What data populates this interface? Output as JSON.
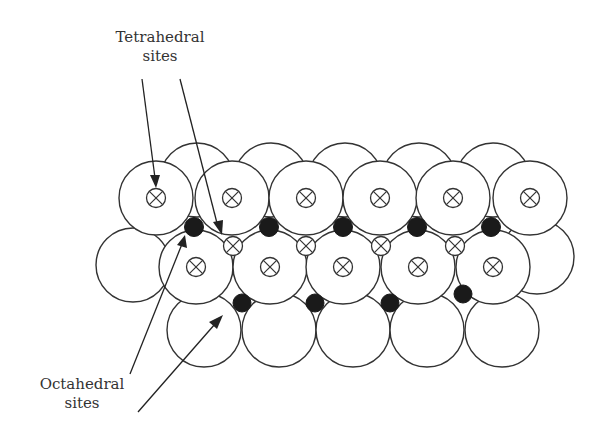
{
  "diagram": {
    "type": "close-packed sphere layers showing interstitial sites",
    "labels": {
      "tetrahedral": {
        "line1": "Tetrahedral",
        "line2": "sites"
      },
      "octahedral": {
        "line1": "Octahedral",
        "line2": "sites"
      }
    },
    "legend_symbols": {
      "tetrahedral_site": "crossed-circle",
      "octahedral_site": "filled-circle"
    },
    "colors": {
      "outline": "#333333",
      "octahedral_fill": "#1a1a1a",
      "background": "#ffffff"
    },
    "counts": {
      "front_top_row_atoms": 6,
      "front_middle_row_atoms": 5,
      "bottom_row_atoms": 5,
      "tetrahedral_sites_between_rows": 4,
      "octahedral_sites_upper": 5,
      "octahedral_sites_lower": 4
    }
  }
}
